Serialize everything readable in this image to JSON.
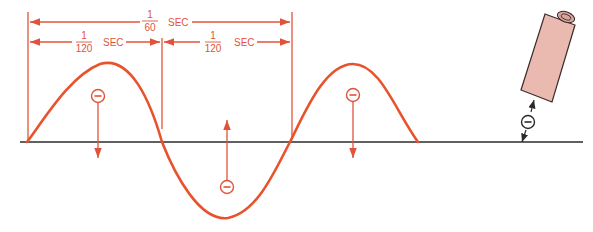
{
  "diagram": {
    "colors": {
      "wave": "#e8532e",
      "dimension": "#e0533a",
      "baseline": "#2b2b2b",
      "probe_fill": "#eab9b0",
      "probe_stroke": "#3a2a2a"
    },
    "full_period": {
      "numerator": "1",
      "denominator": "60",
      "unit": "SEC"
    },
    "half_period_left": {
      "numerator": "1",
      "denominator": "120",
      "unit": "SEC"
    },
    "half_period_right": {
      "numerator": "1",
      "denominator": "120",
      "unit": "SEC"
    },
    "charges": [
      {
        "symbol": "−",
        "position": "first-crest",
        "direction": "down"
      },
      {
        "symbol": "−",
        "position": "trough",
        "direction": "up"
      },
      {
        "symbol": "−",
        "position": "second-crest",
        "direction": "down"
      },
      {
        "symbol": "−",
        "position": "probe-gap",
        "direction": "both"
      }
    ],
    "icons": {
      "electron": "circled-minus",
      "probe": "cylindrical-probe"
    }
  }
}
